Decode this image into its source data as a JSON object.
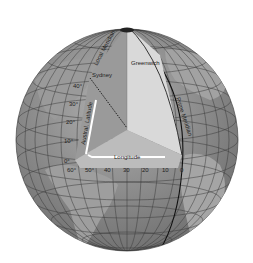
{
  "diagram": {
    "labels": {
      "local_meridian": "Local Meridian",
      "sydney": "Sydney",
      "greenwich": "Greenwich",
      "prime_meridian": "Prime Meridian",
      "latitude": "Austral. Latitude",
      "longitude": "Longitude"
    },
    "latitude_ticks": [
      "40°",
      "30°",
      "20°",
      "10°",
      "0°"
    ],
    "longitude_ticks": [
      "60°",
      "50°",
      "40",
      "30",
      "20",
      "10",
      "0"
    ],
    "colors": {
      "ocean": "#8c8c8c",
      "land": "#a8a8a8",
      "wedge_left": "#9a9a9a",
      "wedge_right": "#d8d8d8",
      "wedge_floor": "#bdbdbd",
      "grid": "#3a3a3a",
      "arrow": "#ffffff"
    }
  }
}
